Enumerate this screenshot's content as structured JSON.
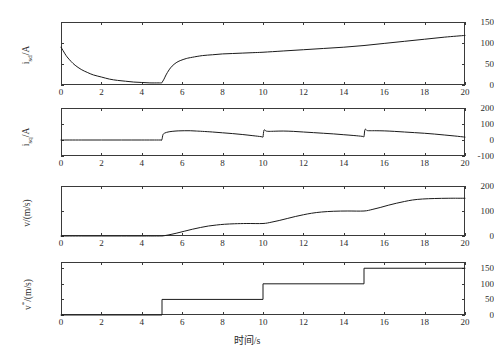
{
  "figure": {
    "title": "",
    "background": "#ffffff",
    "line_color": "#1b1b1b",
    "axis_color": "#3a3a3a"
  },
  "xlabel": "时间/s",
  "xticks": [
    0,
    2,
    4,
    6,
    8,
    10,
    12,
    14,
    16,
    18,
    20
  ],
  "chart_data": [
    {
      "type": "line",
      "title": "",
      "xlabel": "",
      "ylabel": "i_sd/A",
      "ylabel_base": "i",
      "ylabel_sub": "sd",
      "ylabel_unit": "/A",
      "xlim": [
        0,
        20
      ],
      "ylim": [
        0,
        150
      ],
      "xticks": [
        0,
        2,
        4,
        6,
        8,
        10,
        12,
        14,
        16,
        18,
        20
      ],
      "yticks": [
        0,
        50,
        100,
        150
      ],
      "grid": false,
      "legend": "none",
      "x": [
        0,
        0.1,
        0.2,
        0.3,
        0.5,
        0.7,
        1.0,
        1.3,
        1.6,
        2.0,
        2.4,
        2.8,
        3.2,
        3.6,
        4.0,
        4.4,
        4.8,
        4.99,
        5.0,
        5.1,
        5.2,
        5.35,
        5.5,
        5.7,
        5.9,
        6.2,
        6.5,
        7.0,
        7.5,
        8.0,
        8.5,
        9.0,
        9.5,
        10.0,
        11.0,
        12.0,
        13.0,
        14.0,
        15.0,
        16.0,
        17.0,
        18.0,
        19.0,
        20.0
      ],
      "y": [
        90,
        82,
        74,
        67,
        56,
        47,
        37,
        30,
        24,
        19,
        14,
        11,
        9,
        7,
        6,
        5,
        5,
        5,
        6,
        14,
        24,
        36,
        45,
        53,
        58,
        63,
        66,
        70,
        72,
        74,
        75,
        76,
        77,
        78,
        81,
        84,
        87,
        90,
        94,
        99,
        104,
        109,
        114,
        118
      ]
    },
    {
      "type": "line",
      "title": "",
      "xlabel": "",
      "ylabel": "i_sq/A",
      "ylabel_base": "i",
      "ylabel_sub": "sq",
      "ylabel_unit": "/A",
      "xlim": [
        0,
        20
      ],
      "ylim": [
        -100,
        200
      ],
      "xticks": [
        0,
        2,
        4,
        6,
        8,
        10,
        12,
        14,
        16,
        18,
        20
      ],
      "yticks": [
        -100,
        0,
        100,
        200
      ],
      "grid": false,
      "legend": "none",
      "x": [
        0,
        1.0,
        2.0,
        3.0,
        4.0,
        4.9,
        4.98,
        5.0,
        5.05,
        5.15,
        5.3,
        5.5,
        5.8,
        6.1,
        6.4,
        6.7,
        7.0,
        7.5,
        8.0,
        8.5,
        9.0,
        9.5,
        9.9,
        9.98,
        10.0,
        10.05,
        10.15,
        10.3,
        10.6,
        11.0,
        11.5,
        12.0,
        12.5,
        13.0,
        13.5,
        14.0,
        14.5,
        14.9,
        14.98,
        15.0,
        15.05,
        15.15,
        15.3,
        15.6,
        16.0,
        16.5,
        17.0,
        17.5,
        18.0,
        18.5,
        19.0,
        19.5,
        20.0
      ],
      "y": [
        0,
        0,
        0,
        0,
        0,
        0,
        0,
        2,
        34,
        44,
        50,
        54,
        57,
        58,
        58,
        56,
        54,
        50,
        45,
        40,
        34,
        27,
        21,
        18,
        18,
        62,
        56,
        54,
        55,
        56,
        54,
        50,
        46,
        42,
        38,
        33,
        28,
        23,
        20,
        20,
        66,
        59,
        58,
        58,
        57,
        54,
        50,
        46,
        42,
        37,
        31,
        25,
        18
      ]
    },
    {
      "type": "line",
      "title": "",
      "xlabel": "",
      "ylabel": "v/(m/s)",
      "ylabel_base": "v",
      "ylabel_sub": "",
      "ylabel_unit": "/(m/s)",
      "xlim": [
        0,
        20
      ],
      "ylim": [
        0,
        200
      ],
      "xticks": [
        0,
        2,
        4,
        6,
        8,
        10,
        12,
        14,
        16,
        18,
        20
      ],
      "yticks": [
        0,
        100,
        200
      ],
      "grid": false,
      "legend": "none",
      "x": [
        0,
        1.0,
        2.0,
        3.0,
        4.0,
        4.8,
        5.0,
        5.3,
        5.7,
        6.1,
        6.5,
        6.9,
        7.3,
        7.7,
        8.1,
        8.6,
        9.2,
        10.0,
        10.4,
        10.8,
        11.2,
        11.6,
        12.0,
        12.4,
        12.9,
        13.5,
        14.2,
        15.0,
        15.4,
        15.8,
        16.2,
        16.6,
        17.0,
        17.4,
        17.9,
        18.5,
        19.2,
        20.0
      ],
      "y": [
        0,
        0,
        0,
        0,
        0,
        0,
        0,
        4,
        11,
        19,
        27,
        34,
        40,
        44,
        47,
        49,
        50,
        50,
        55,
        62,
        70,
        78,
        85,
        91,
        96,
        99,
        100,
        100,
        106,
        114,
        123,
        131,
        138,
        144,
        148,
        150,
        151,
        151
      ]
    },
    {
      "type": "line",
      "title": "",
      "xlabel": "时间/s",
      "ylabel": "v*/(m/s)",
      "ylabel_base": "v",
      "ylabel_sub": "*",
      "ylabel_unit": "/(m/s)",
      "xlim": [
        0,
        20
      ],
      "ylim": [
        0,
        170
      ],
      "xticks": [
        0,
        2,
        4,
        6,
        8,
        10,
        12,
        14,
        16,
        18,
        20
      ],
      "yticks": [
        0,
        50,
        100,
        150
      ],
      "grid": false,
      "legend": "none",
      "step": true,
      "x": [
        0,
        5,
        5,
        10,
        10,
        15,
        15,
        20
      ],
      "y": [
        0,
        0,
        50,
        50,
        100,
        100,
        150,
        150
      ]
    }
  ]
}
